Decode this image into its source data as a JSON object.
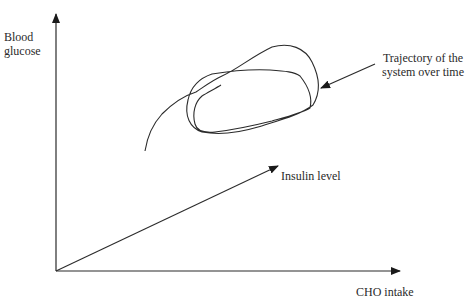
{
  "diagram": {
    "axes": {
      "y_label_line1": "Blood",
      "y_label_line2": "glucose",
      "x_label": "CHO intake",
      "z_label": "Insulin level"
    },
    "annotation": {
      "line1": "Trajectory of the",
      "line2": "system over time"
    },
    "colors": {
      "line": "#2b2b2b",
      "background": "#ffffff"
    }
  }
}
